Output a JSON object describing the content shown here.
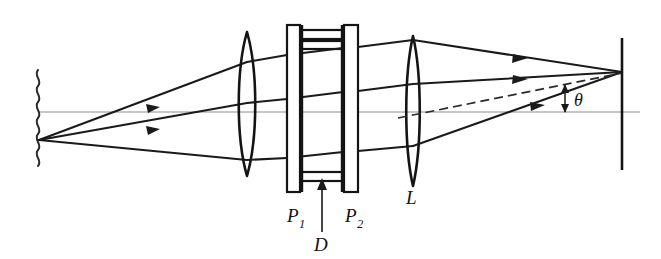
{
  "figure": {
    "background_color": "#ffffff",
    "ink_color": "#141414",
    "axis_color": "#8d8d8d",
    "labels": {
      "plate_1": "P",
      "plate_1_sub": "1",
      "plate_2": "P",
      "plate_2_sub": "2",
      "gap": "D",
      "lens": "L",
      "angle": "θ"
    },
    "components": [
      {
        "name": "extended-source",
        "label": "",
        "kind": "wavy-line",
        "x": 38,
        "y_top": 72,
        "y_bottom": 158
      },
      {
        "name": "collimating-lens",
        "label": "",
        "kind": "biconvex-lens",
        "x": 247,
        "y_top": 32,
        "y_bottom": 176,
        "half_width": 12
      },
      {
        "name": "etalon-plate-1",
        "label": "P1",
        "kind": "plate",
        "x": 287,
        "width": 13,
        "y_top": 25,
        "y_bottom": 192
      },
      {
        "name": "etalon-plate-2",
        "label": "P2",
        "kind": "plate",
        "x": 343,
        "width": 14,
        "y_top": 25,
        "y_bottom": 192
      },
      {
        "name": "etalon-gap",
        "label": "D",
        "kind": "spacer-gap",
        "x_left": 300,
        "x_right": 343
      },
      {
        "name": "focusing-lens",
        "label": "L",
        "kind": "biconvex-lens",
        "x": 413,
        "y_top": 36,
        "y_bottom": 186,
        "half_width": 9
      },
      {
        "name": "observation-screen",
        "label": "",
        "kind": "vertical-line",
        "x": 622,
        "y_top": 38,
        "y_bottom": 170
      }
    ],
    "optical_axis": {
      "y": 112,
      "x_start": 38,
      "x_end": 640
    },
    "focal_point": {
      "x": 622,
      "y": 72
    },
    "source_point": {
      "x": 38,
      "y": 140
    },
    "angle_marker": {
      "label": "θ",
      "x": 565,
      "y_top": 85,
      "y_bottom": 112
    }
  }
}
